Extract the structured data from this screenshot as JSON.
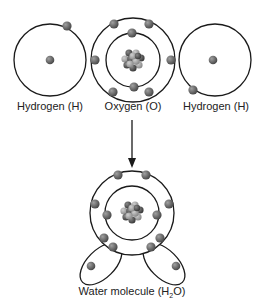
{
  "diagram": {
    "atoms": [
      {
        "id": "hydrogen-left",
        "label": "Hydrogen (H)",
        "electrons": 1
      },
      {
        "id": "oxygen",
        "label": "Oxygen (O)",
        "electrons": 8,
        "shells": [
          2,
          6
        ]
      },
      {
        "id": "hydrogen-right",
        "label": "Hydrogen (H)",
        "electrons": 1
      }
    ],
    "result": {
      "label_prefix": "Water molecule (H",
      "label_sub": "2",
      "label_suffix": "O)"
    },
    "colors": {
      "line": "#1a1a1a",
      "electron": "#6b6b6b",
      "nucleus_dark": "#555555",
      "nucleus_light": "#a8a8a8"
    }
  }
}
